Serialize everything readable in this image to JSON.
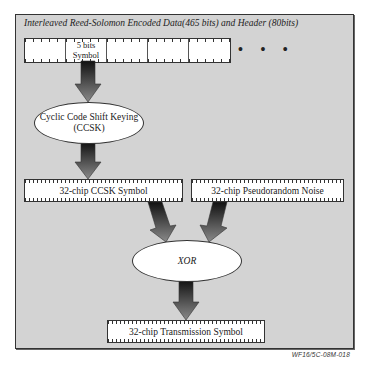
{
  "diagram": {
    "title": "Interleaved Reed-Solomon Encoded Data(465 bits) and Header (80bits)",
    "symbol_strip": {
      "cells": [
        "",
        "5 bits Symbol",
        "",
        "",
        ""
      ],
      "cell_1_line1": "5 bits",
      "cell_1_line2": "Symbol",
      "continuation": "• • •"
    },
    "ccsk_node": {
      "line1": "Cyclic Code Shift Keying",
      "line2": "(CCSK)"
    },
    "ccsk_symbol_box": "32-chip CCSK Symbol",
    "pn_box": "32-chip Pseudorandom Noise",
    "xor_node": "XOR",
    "transmission_box": "32-chip Transmission Symbol",
    "figure_id": "WF16/5C-08M-018",
    "colors": {
      "background": "#d3d3d3",
      "box_fill": "#ffffff",
      "border": "#333333",
      "arrow_top": "#111111",
      "arrow_bottom": "#888888"
    },
    "edges": [
      {
        "from": "5 bits Symbol",
        "to": "Cyclic Code Shift Keying (CCSK)"
      },
      {
        "from": "Cyclic Code Shift Keying (CCSK)",
        "to": "32-chip CCSK Symbol"
      },
      {
        "from": "32-chip CCSK Symbol",
        "to": "XOR"
      },
      {
        "from": "32-chip Pseudorandom Noise",
        "to": "XOR"
      },
      {
        "from": "XOR",
        "to": "32-chip Transmission Symbol"
      }
    ]
  }
}
